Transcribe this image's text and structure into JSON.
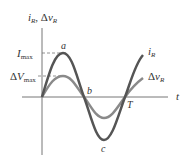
{
  "diagram": {
    "y_axis_label": "i_R, Δv_R",
    "x_axis_label": "t",
    "ticks": {
      "imax": "I_max",
      "dvmax": "ΔV_max"
    },
    "points": {
      "a": "a",
      "b": "b",
      "c": "c",
      "T": "T"
    },
    "curves": [
      {
        "name": "i_R",
        "label": "i_R",
        "color": "#555555",
        "amplitude": "I_max"
      },
      {
        "name": "dv_R",
        "label": "Δv_R",
        "color": "#8a8a8a",
        "amplitude": "ΔV_max"
      }
    ]
  }
}
